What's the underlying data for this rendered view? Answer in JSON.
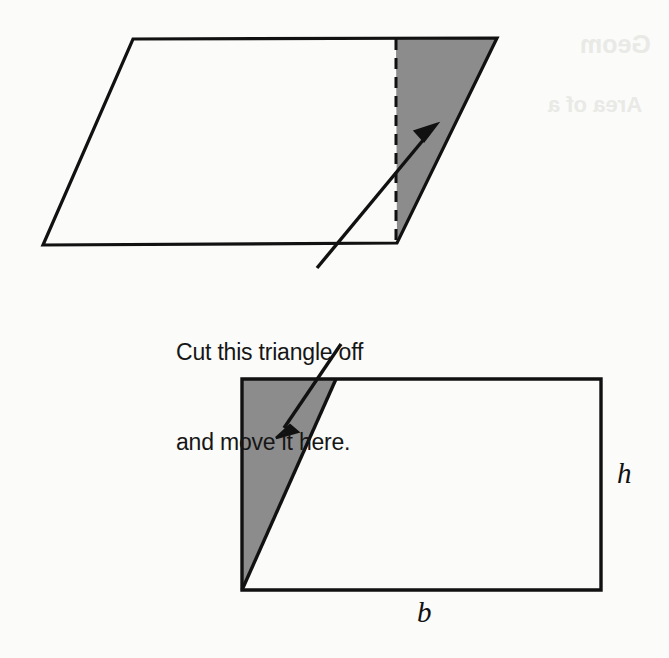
{
  "figure": {
    "background_color": "#fbfbfa",
    "ink_color": "#111111",
    "shade_color": "#8c8c8c",
    "caption": {
      "line1": "Cut this triangle off",
      "line2": "and move it here."
    },
    "labels": {
      "height": "h",
      "base": "b"
    },
    "ghost_text": {
      "line1": "Geom",
      "line2": "Area of a"
    },
    "parallelogram": {
      "name": "parallelogram-shape",
      "points": "133,39 497,38 397,243 43,245",
      "cut_line_points": "396,39 396,243",
      "shaded_triangle_points": "396,39 497,38 397,243"
    },
    "rectangle": {
      "name": "rectangle-shape",
      "points": "242,379 601,379 601,590 242,590",
      "shaded_triangle_points": "242,379 336,379 242,590",
      "cut_line_points": "336,379 242,590"
    },
    "arrow_up": {
      "shaft_points": "317,268 429,133",
      "head_points": "437,124 415,131 424,141"
    },
    "arrow_down": {
      "shaft_points": "341,344 284,428",
      "head_points": "276,438 290,425 298,432"
    }
  }
}
